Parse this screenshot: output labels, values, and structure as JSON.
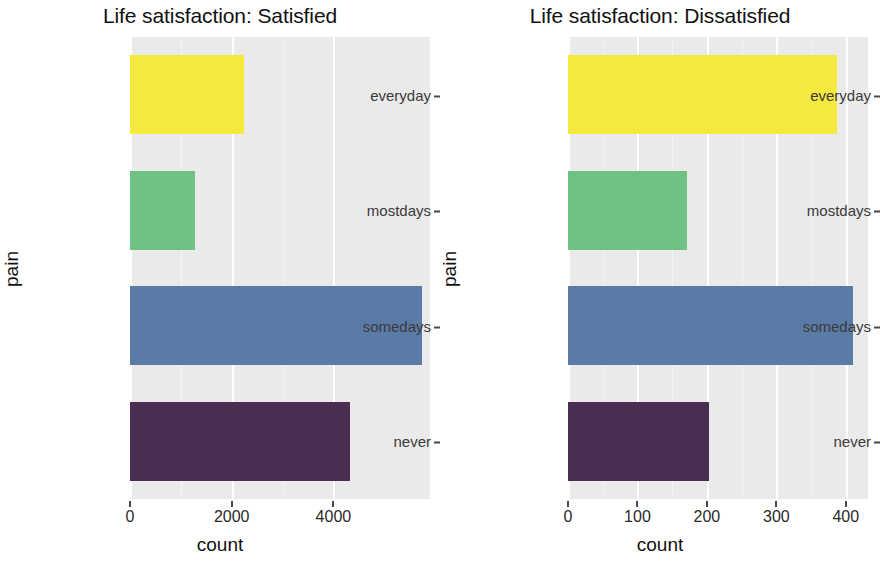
{
  "chart_data": {
    "type": "bar",
    "orientation": "horizontal",
    "title": "",
    "facet_variable": "Life satisfaction",
    "xlabel": "count",
    "ylabel": "pain",
    "grid": true,
    "legend": "none",
    "categories": [
      "everyday",
      "mostdays",
      "somedays",
      "never"
    ],
    "category_colors": [
      "#F5E93E",
      "#6FC281",
      "#5A7BA8",
      "#482F52"
    ],
    "panels": [
      {
        "title": "Life satisfaction: Satisfied",
        "xlabel": "count",
        "ylabel": "pain",
        "xlim": [
          0,
          5900
        ],
        "xticks": [
          0,
          2000,
          4000
        ],
        "xtick_labels": [
          "0",
          "2000",
          "4000"
        ],
        "categories": [
          "everyday",
          "mostdays",
          "somedays",
          "never"
        ],
        "values": [
          2250,
          1280,
          5750,
          4330
        ]
      },
      {
        "title": "Life satisfaction: Dissatisfied",
        "xlabel": "count",
        "ylabel": "pain",
        "xlim": [
          0,
          432
        ],
        "xticks": [
          0,
          100,
          200,
          300,
          400
        ],
        "xtick_labels": [
          "0",
          "100",
          "200",
          "300",
          "400"
        ],
        "categories": [
          "everyday",
          "mostdays",
          "somedays",
          "never"
        ],
        "values": [
          387,
          172,
          410,
          203
        ]
      }
    ]
  },
  "panel_background": "#eaeaea",
  "gridline_color": "#ffffff"
}
